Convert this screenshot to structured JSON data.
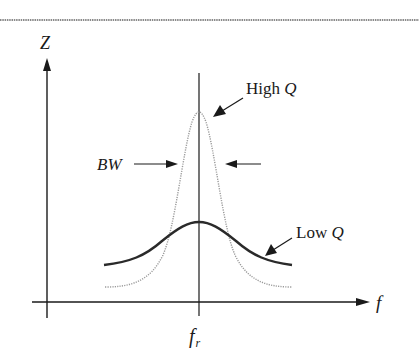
{
  "figure": {
    "border_color": "#8a8a8a",
    "axis_color": "#1a1a1a",
    "high_q_color": "#9a9a9a",
    "low_q_color": "#2a2a2a",
    "y_axis_label": "Z",
    "x_axis_label": "f",
    "center_tick_label_main": "f",
    "center_tick_label_sub": "r",
    "bandwidth_label": "BW",
    "high_q_label_prefix": "High ",
    "high_q_label_var": "Q",
    "low_q_label_prefix": "Low ",
    "low_q_label_var": "Q"
  },
  "curves": [
    {
      "name": "High Q",
      "style": "dotted",
      "peak_at": "f_r",
      "relative_peak": 1.0,
      "relative_width": "narrow"
    },
    {
      "name": "Low Q",
      "style": "solid",
      "peak_at": "f_r",
      "relative_peak": 0.45,
      "relative_width": "wide"
    }
  ]
}
